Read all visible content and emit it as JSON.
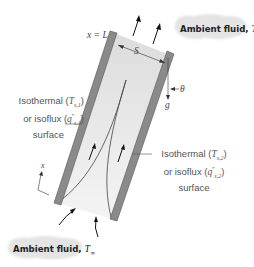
{
  "diagram": {
    "top_label": "x = L",
    "spacing_label": "S",
    "angle_label": "θ",
    "gravity_label": "g",
    "axis_label": "x",
    "ambient_top": {
      "text": "Ambient fluid, ",
      "symbol": "T",
      "subscript": "∞"
    },
    "ambient_bottom": {
      "text": "Ambient fluid, ",
      "symbol": "T",
      "subscript": "∞"
    },
    "left_surface": {
      "line1_text": "Isothermal (",
      "line1_symbol": "T",
      "line1_sub": "s,1",
      "line1_end": ")",
      "line2_text": "or isoflux (",
      "line2_symbol": "q",
      "line2_sup": "″",
      "line2_sub": "s,1",
      "line2_end": ")",
      "line3": "surface"
    },
    "right_surface": {
      "line1_text": "Isothermal (",
      "line1_symbol": "T",
      "line1_sub": "s,2",
      "line1_end": ")",
      "line2_text": "or isoflux (",
      "line2_symbol": "q",
      "line2_sup": "″",
      "line2_sub": "s,2",
      "line2_end": ")",
      "line3": "surface"
    },
    "colors": {
      "plate": "#8a8a8a",
      "plate_edge": "#555555",
      "fluid_fill": "#dcdcdc",
      "inlet_fill": "#efefef",
      "cloud": "#e6e6e6",
      "arrow": "#1a1a1a",
      "text": "#555555"
    }
  }
}
